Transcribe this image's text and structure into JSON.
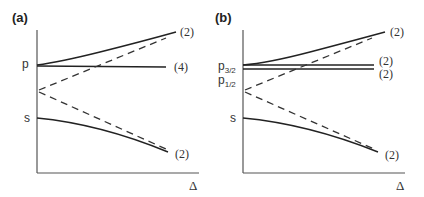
{
  "figure": {
    "panels": [
      {
        "id": "a",
        "label": "(a)",
        "xaxis_label": "Δ",
        "levels": [
          {
            "name": "p",
            "label": "p"
          },
          {
            "name": "s",
            "label": "s"
          }
        ],
        "curves": [
          {
            "name": "upper-shifted",
            "style": "solid",
            "degeneracy": "(2)"
          },
          {
            "name": "p-unshifted",
            "style": "solid",
            "degeneracy": "(4)"
          },
          {
            "name": "lower-shifted",
            "style": "solid",
            "degeneracy": "(2)"
          },
          {
            "name": "dressed-up",
            "style": "dashed"
          },
          {
            "name": "dressed-down",
            "style": "dashed"
          }
        ]
      },
      {
        "id": "b",
        "label": "(b)",
        "xaxis_label": "Δ",
        "levels": [
          {
            "name": "p3/2",
            "label": "p",
            "sub": "3/2"
          },
          {
            "name": "p1/2",
            "label": "p",
            "sub": "1/2"
          },
          {
            "name": "s",
            "label": "s"
          }
        ],
        "curves": [
          {
            "name": "upper-shifted",
            "style": "solid",
            "degeneracy": "(2)"
          },
          {
            "name": "p3/2-unshifted",
            "style": "solid",
            "degeneracy": "(2)"
          },
          {
            "name": "p1/2-unshifted",
            "style": "solid",
            "degeneracy": "(2)"
          },
          {
            "name": "lower-shifted",
            "style": "solid",
            "degeneracy": "(2)"
          },
          {
            "name": "dressed-up",
            "style": "dashed"
          },
          {
            "name": "dressed-down",
            "style": "dashed"
          }
        ]
      }
    ]
  }
}
